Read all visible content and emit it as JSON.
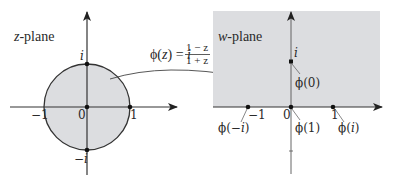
{
  "figure": {
    "type": "conformal-map-diagram",
    "colors": {
      "region_fill": "#dcdde0",
      "stroke": "#333333",
      "background": "#ffffff"
    },
    "left_panel": {
      "title_var": "z",
      "title_suffix": "-plane",
      "region": "unit disk",
      "points": [
        {
          "label": "0",
          "coord": "0"
        },
        {
          "label": "1",
          "coord": "1"
        },
        {
          "label": "−1",
          "coord": "-1"
        },
        {
          "label": "i",
          "coord": "i"
        },
        {
          "label": "−i",
          "coord": "-i"
        }
      ],
      "labels": {
        "origin": "0",
        "one": "1",
        "neg_one": "−1",
        "i": "i",
        "neg_i_sign": "−",
        "neg_i_var": "i"
      }
    },
    "mapping": {
      "lhs": "ϕ(z) = ",
      "lhs_fn": "ϕ(",
      "lhs_var": "z",
      "lhs_close": ")",
      "eq": " = ",
      "coef": "i",
      "numerator": "1 − z",
      "denominator": "1 + z"
    },
    "right_panel": {
      "title_var": "w",
      "title_suffix": "-plane",
      "region": "upper half-plane",
      "axis_labels": {
        "origin": "0",
        "one": "1",
        "neg_one": "−1",
        "i": "i"
      },
      "image_labels": {
        "phi_0": "ϕ(0)",
        "phi_1": "ϕ(1)",
        "phi_neg_i_prefix": "ϕ(−",
        "phi_neg_i_var": "i",
        "phi_neg_i_suffix": ")",
        "phi_i_prefix": "ϕ(",
        "phi_i_var": "i",
        "phi_i_suffix": ")"
      }
    }
  }
}
